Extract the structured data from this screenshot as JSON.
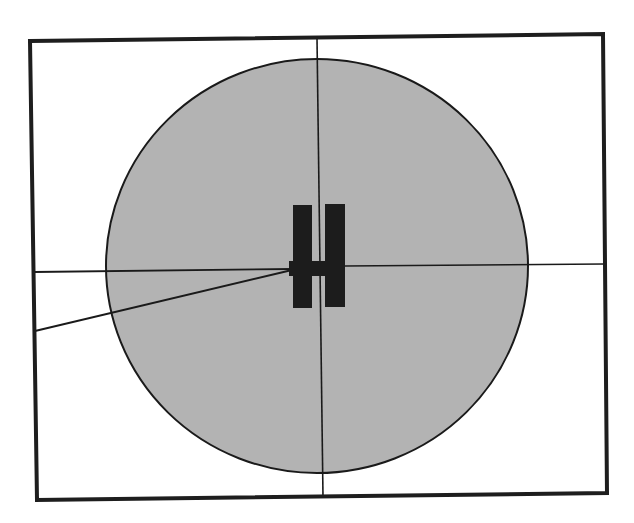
{
  "diagram": {
    "type": "technical-line-drawing",
    "colors": {
      "background": "#ffffff",
      "frame_stroke": "#1e1e1e",
      "circle_fill": "#b3b3b3",
      "circle_stroke": "#1a1a1a",
      "line_stroke": "#1a1a1a",
      "object_fill": "#1c1c1c"
    },
    "frame": {
      "corners": {
        "top_left": [
          30,
          41
        ],
        "top_right": [
          603,
          34
        ],
        "bottom_right": [
          607,
          493
        ],
        "bottom_left": [
          37,
          500
        ]
      },
      "stroke_width": 4
    },
    "circle": {
      "cx": 317,
      "cy": 266,
      "rx": 211,
      "ry": 207,
      "stroke_width": 2
    },
    "crosshair": {
      "vertical": {
        "x1": 317,
        "y1": 38,
        "x2": 323,
        "y2": 497
      },
      "horizontal_left": {
        "x1": 34,
        "y1": 272,
        "x2": 293,
        "y2": 269
      },
      "horizontal_right": {
        "x1": 345,
        "y1": 266,
        "x2": 604,
        "y2": 264
      }
    },
    "angled_line": {
      "x1": 35,
      "y1": 331,
      "x2": 292,
      "y2": 270
    },
    "h_object": {
      "left_bar": {
        "x": 293,
        "y": 205,
        "width": 19,
        "height": 103
      },
      "right_bar": {
        "x": 325,
        "y": 204,
        "width": 20,
        "height": 103
      },
      "crossbar": {
        "x": 289,
        "y": 261,
        "width": 56,
        "height": 15
      }
    }
  }
}
